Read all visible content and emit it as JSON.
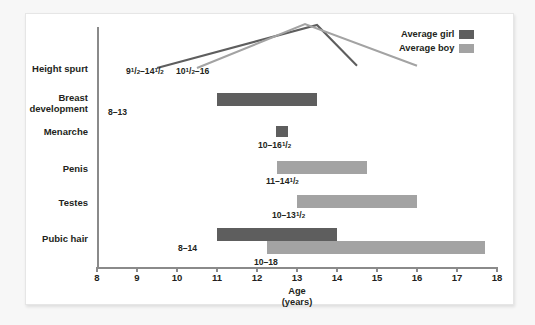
{
  "chart_data": {
    "type": "bar",
    "title": "",
    "subtitle": "",
    "xlabel": "Age",
    "xlabel_sub": "(years)",
    "ylabel": "",
    "xlim": [
      8,
      18
    ],
    "xticks": [
      8,
      9,
      10,
      11,
      12,
      13,
      14,
      15,
      16,
      17,
      18
    ],
    "xtick_labels": [
      "8",
      "9",
      "10",
      "11",
      "12",
      "13",
      "14",
      "15",
      "16",
      "17",
      "18"
    ],
    "grid": false,
    "legend_position": "top-right",
    "legend": [
      {
        "name": "Average girl",
        "color": "#5e5e5e"
      },
      {
        "name": "Average boy",
        "color": "#a3a3a3"
      }
    ],
    "categories": [
      "Height spurt",
      "Breast\ndevelopment",
      "Menarche",
      "Penis",
      "Testes",
      "Pubic hair"
    ],
    "bars": [
      {
        "category": "Breast development",
        "series": "Average girl",
        "start": 11.0,
        "end": 13.5,
        "label": "8–13",
        "label_html": "8–13",
        "color": "#5e5e5e"
      },
      {
        "category": "Menarche",
        "series": "Average girl",
        "start": 12.48,
        "end": 12.78,
        "label": "10–16 1/2",
        "label_html": "10–16<sup>1</sup>/<sub>2</sub>",
        "color": "#5e5e5e"
      },
      {
        "category": "Penis",
        "series": "Average boy",
        "start": 12.5,
        "end": 14.75,
        "label": "11–14 1/2",
        "label_html": "11–14<sup>1</sup>/<sub>2</sub>",
        "color": "#a3a3a3"
      },
      {
        "category": "Testes",
        "series": "Average boy",
        "start": 13.0,
        "end": 16.0,
        "label": "10–13 1/2",
        "label_html": "10–13<sup>1</sup>/<sub>2</sub>",
        "color": "#a3a3a3"
      },
      {
        "category": "Pubic hair",
        "series": "Average girl",
        "start": 11.0,
        "end": 14.0,
        "label": "8–14",
        "label_html": "8–14",
        "color": "#5e5e5e"
      },
      {
        "category": "Pubic hair",
        "series": "Average boy",
        "start": 12.25,
        "end": 17.7,
        "label": "10–18",
        "label_html": "10–18",
        "color": "#a3a3a3"
      }
    ],
    "curves": [
      {
        "category": "Height spurt",
        "series": "Average girl",
        "label": "9 1/2–14 1/2",
        "label_html": "9<sup>1</sup>/<sub>2</sub>–14<sup>1</sup>/<sub>2</sub>",
        "color": "#5e5e5e",
        "points": [
          [
            9.5,
            0
          ],
          [
            13.5,
            1.0
          ],
          [
            14.5,
            0.05
          ]
        ]
      },
      {
        "category": "Height spurt",
        "series": "Average boy",
        "label": "10 1/2–16",
        "label_html": "10<sup>1</sup>/<sub>2</sub>–16",
        "color": "#a3a3a3",
        "points": [
          [
            10.5,
            0
          ],
          [
            13.2,
            1.02
          ],
          [
            16.0,
            0.05
          ]
        ]
      }
    ]
  },
  "axis": {
    "x_title": "Age",
    "x_title_sub": "(years)"
  },
  "colors": {
    "girl": "#5e5e5e",
    "boy": "#a3a3a3",
    "axis": "#8a8a8a",
    "text": "#231f20",
    "card": "#ffffff",
    "background": "#f7f7f7"
  }
}
